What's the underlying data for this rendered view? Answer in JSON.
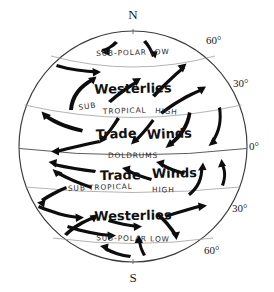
{
  "figure": {
    "type": "diagram",
    "background_color": "#ffffff",
    "ink_color": "#111111",
    "graticule_color": "#9a9a9a"
  },
  "poles": {
    "north_label": "N",
    "south_label": "S"
  },
  "latitude_labels": [
    {
      "id": "n60",
      "text": "60°",
      "hemisphere": "north",
      "degrees": 60
    },
    {
      "id": "n30",
      "text": "30°",
      "hemisphere": "north",
      "degrees": 30
    },
    {
      "id": "eq",
      "text": "0°",
      "hemisphere": "equator",
      "degrees": 0
    },
    {
      "id": "s30",
      "text": "30°",
      "hemisphere": "south",
      "degrees": 30
    },
    {
      "id": "s60",
      "text": "60°",
      "hemisphere": "south",
      "degrees": 60
    }
  ],
  "pressure_bands": [
    {
      "id": "n-subpolar-low",
      "text": "SUB-POLAR LOW",
      "hemisphere": "north",
      "latitude": 60
    },
    {
      "id": "n-subtropical-high",
      "text": "SUB TROPICAL HIGH",
      "hemisphere": "north",
      "latitude": 30
    },
    {
      "id": "doldrums",
      "text": "DOLDRUMS",
      "hemisphere": "equator",
      "latitude": 0
    },
    {
      "id": "s-subtropical-high",
      "text": "SUB TROPICAL HIGH",
      "hemisphere": "south",
      "latitude": 30
    },
    {
      "id": "s-subpolar-low",
      "text": "SUB-POLAR LOW",
      "hemisphere": "south",
      "latitude": 60
    }
  ],
  "wind_belts": [
    {
      "id": "n-westerlies",
      "text": "Westerlies",
      "hemisphere": "north",
      "latitude_range": [
        30,
        60
      ]
    },
    {
      "id": "n-trade-winds",
      "text": "Trade  Winds",
      "hemisphere": "north",
      "latitude_range": [
        0,
        30
      ]
    },
    {
      "id": "s-trade-winds",
      "text": "Trade  Winds",
      "hemisphere": "south",
      "latitude_range": [
        0,
        30
      ]
    },
    {
      "id": "s-westerlies",
      "text": "Westerlies",
      "hemisphere": "south",
      "latitude_range": [
        30,
        60
      ]
    }
  ],
  "band_label_parts": {
    "subtropical_high_north": [
      "SUB",
      "TROPICAL",
      "HIGH"
    ],
    "subtropical_high_south": [
      "SUB TROPICAL",
      "HIGH"
    ],
    "trade_north": [
      "Trade",
      "Winds"
    ],
    "trade_south": [
      "Trade",
      "Winds"
    ]
  }
}
